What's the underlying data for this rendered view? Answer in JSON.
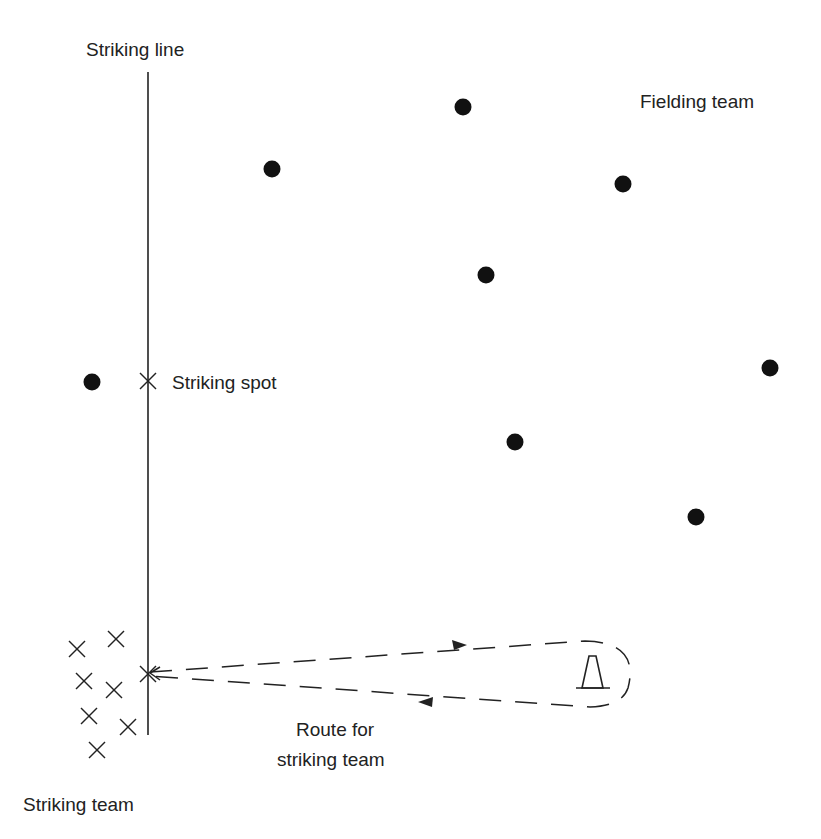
{
  "labels": {
    "striking_line": "Striking line",
    "fielding_team": "Fielding team",
    "striking_spot": "Striking spot",
    "route_line1": "Route for",
    "route_line2": "striking team",
    "striking_team": "Striking team"
  },
  "colors": {
    "ink": "#222222",
    "dot": "#111111",
    "background": "#ffffff"
  },
  "striking_line": {
    "x": 148,
    "y1": 72,
    "y2": 735
  },
  "striking_spot": {
    "x": 148,
    "y": 381
  },
  "fielders": [
    {
      "x": 463,
      "y": 107
    },
    {
      "x": 272,
      "y": 169
    },
    {
      "x": 623,
      "y": 184
    },
    {
      "x": 486,
      "y": 275
    },
    {
      "x": 92,
      "y": 382
    },
    {
      "x": 770,
      "y": 368
    },
    {
      "x": 515,
      "y": 442
    },
    {
      "x": 696,
      "y": 517
    }
  ],
  "strikers": [
    {
      "x": 116,
      "y": 639
    },
    {
      "x": 77,
      "y": 649
    },
    {
      "x": 84,
      "y": 681
    },
    {
      "x": 114,
      "y": 690
    },
    {
      "x": 89,
      "y": 716
    },
    {
      "x": 128,
      "y": 727
    },
    {
      "x": 97,
      "y": 750
    }
  ],
  "route": {
    "start": {
      "x": 148,
      "y": 674
    },
    "cone": {
      "x": 592,
      "y": 670
    },
    "arrow_out": {
      "x": 465,
      "y": 645
    },
    "arrow_back": {
      "x": 420,
      "y": 702
    }
  }
}
